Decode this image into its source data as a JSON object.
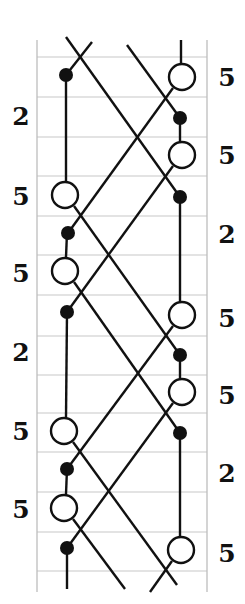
{
  "diagram": {
    "type": "crossing-strand-chart",
    "colors": {
      "background": "#ffffff",
      "grid": "#c8c8c8",
      "border": "#bdbdbd",
      "line": "#111111",
      "node_fill": "#111111",
      "node_open_fill": "#ffffff"
    },
    "frame": {
      "left": 37,
      "right": 207,
      "top": 40,
      "bottom": 592
    },
    "grid_rows_y": [
      57,
      97,
      137,
      176,
      216,
      255,
      295,
      336,
      375,
      413,
      452,
      492,
      532,
      571
    ],
    "columns_x": {
      "left": 65,
      "right": 181
    },
    "left_labels": [
      {
        "text": "2",
        "x": 21,
        "y": 116
      },
      {
        "text": "5",
        "x": 21,
        "y": 196
      },
      {
        "text": "5",
        "x": 21,
        "y": 273
      },
      {
        "text": "2",
        "x": 21,
        "y": 352
      },
      {
        "text": "5",
        "x": 21,
        "y": 431
      },
      {
        "text": "5",
        "x": 21,
        "y": 509
      }
    ],
    "right_labels": [
      {
        "text": "5",
        "x": 227,
        "y": 77
      },
      {
        "text": "5",
        "x": 227,
        "y": 155
      },
      {
        "text": "2",
        "x": 227,
        "y": 234
      },
      {
        "text": "5",
        "x": 227,
        "y": 318
      },
      {
        "text": "5",
        "x": 227,
        "y": 395
      },
      {
        "text": "2",
        "x": 227,
        "y": 473
      },
      {
        "text": "5",
        "x": 227,
        "y": 553
      }
    ],
    "open_nodes": [
      {
        "x": 182,
        "y": 77
      },
      {
        "x": 182,
        "y": 155
      },
      {
        "x": 65,
        "y": 195
      },
      {
        "x": 65,
        "y": 271
      },
      {
        "x": 182,
        "y": 315
      },
      {
        "x": 182,
        "y": 392
      },
      {
        "x": 64,
        "y": 431
      },
      {
        "x": 64,
        "y": 508
      },
      {
        "x": 181,
        "y": 550
      }
    ],
    "filled_nodes": [
      {
        "x": 66,
        "y": 75
      },
      {
        "x": 180,
        "y": 118
      },
      {
        "x": 180,
        "y": 197
      },
      {
        "x": 68,
        "y": 233
      },
      {
        "x": 67,
        "y": 312
      },
      {
        "x": 180,
        "y": 355
      },
      {
        "x": 180,
        "y": 433
      },
      {
        "x": 67,
        "y": 469
      },
      {
        "x": 67,
        "y": 548
      }
    ],
    "segments": [
      {
        "x1": 181,
        "y1": 40,
        "x2": 181,
        "y2": 63
      },
      {
        "x1": 66,
        "y1": 75,
        "x2": 66,
        "y2": 181
      },
      {
        "x1": 180,
        "y1": 118,
        "x2": 180,
        "y2": 141
      },
      {
        "x1": 180,
        "y1": 197,
        "x2": 180,
        "y2": 301
      },
      {
        "x1": 67,
        "y1": 233,
        "x2": 66,
        "y2": 257
      },
      {
        "x1": 67,
        "y1": 312,
        "x2": 66,
        "y2": 417
      },
      {
        "x1": 180,
        "y1": 355,
        "x2": 180,
        "y2": 378
      },
      {
        "x1": 180,
        "y1": 433,
        "x2": 180,
        "y2": 536
      },
      {
        "x1": 67,
        "y1": 469,
        "x2": 66,
        "y2": 494
      },
      {
        "x1": 67,
        "y1": 548,
        "x2": 67,
        "y2": 589
      },
      {
        "x1": 66,
        "y1": 37,
        "x2": 180,
        "y2": 197
      },
      {
        "x1": 92,
        "y1": 42,
        "x2": 66,
        "y2": 75
      },
      {
        "x1": 127,
        "y1": 45,
        "x2": 180,
        "y2": 118
      },
      {
        "x1": 173,
        "y1": 88,
        "x2": 68,
        "y2": 233
      },
      {
        "x1": 173,
        "y1": 166,
        "x2": 67,
        "y2": 312
      },
      {
        "x1": 74,
        "y1": 206,
        "x2": 180,
        "y2": 355
      },
      {
        "x1": 74,
        "y1": 282,
        "x2": 180,
        "y2": 433
      },
      {
        "x1": 173,
        "y1": 326,
        "x2": 67,
        "y2": 469
      },
      {
        "x1": 173,
        "y1": 403,
        "x2": 67,
        "y2": 548
      },
      {
        "x1": 73,
        "y1": 442,
        "x2": 177,
        "y2": 585
      },
      {
        "x1": 73,
        "y1": 519,
        "x2": 125,
        "y2": 589
      },
      {
        "x1": 172,
        "y1": 561,
        "x2": 150,
        "y2": 592
      }
    ],
    "node_radius_open": 13,
    "node_radius_filled": 7
  }
}
